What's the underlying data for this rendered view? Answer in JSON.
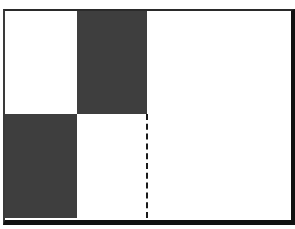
{
  "diagram": {
    "frame": {
      "x": 3,
      "y": 9,
      "width": 286,
      "height": 209,
      "border_color": "#111111"
    },
    "blocks": [
      {
        "name": "top-middle-dark-block",
        "x": 77,
        "y": 11,
        "width": 70,
        "height": 103,
        "color": "#3e3e3e"
      },
      {
        "name": "bottom-left-dark-block",
        "x": 5,
        "y": 114,
        "width": 72,
        "height": 104,
        "color": "#3e3e3e"
      }
    ],
    "dashed_line": {
      "x": 147,
      "y_start": 114,
      "y_end": 218,
      "color": "#1a1a1a"
    }
  }
}
